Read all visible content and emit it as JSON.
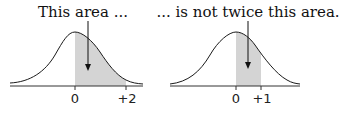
{
  "panels": [
    {
      "caption": "This area ...",
      "ticks": [
        {
          "label": "0",
          "x": 0
        },
        {
          "label": "+2",
          "x": 2
        }
      ],
      "shaded_range": [
        0,
        2
      ]
    },
    {
      "caption": "... is not twice this area.",
      "ticks": [
        {
          "label": "0",
          "x": 0
        },
        {
          "label": "+1",
          "x": 1
        }
      ],
      "shaded_range": [
        0,
        1
      ]
    }
  ],
  "colors": {
    "curve": "#1a1a1a",
    "shade": "#d4d4d4",
    "axis": "#333333"
  }
}
